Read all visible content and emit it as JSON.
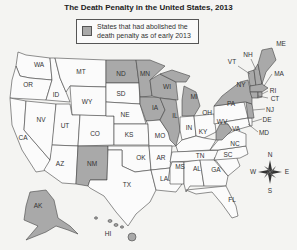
{
  "title": "The Death Penalty in the United States, 2013",
  "legend": {
    "line1": "States that had abolished the",
    "line2": "death penalty as of early 2013",
    "swatch_color": "#a9a9a9"
  },
  "colors": {
    "abolished": "#a9a9a9",
    "retained": "#fbfbfb",
    "border": "#444444"
  },
  "compass": {
    "n": "N",
    "s": "S",
    "e": "E",
    "w": "W"
  },
  "abolished_states": [
    "ND",
    "MN",
    "IA",
    "WI",
    "IL",
    "MI",
    "NM",
    "NY",
    "VT",
    "NH",
    "ME",
    "MA",
    "RI",
    "CT",
    "NJ",
    "WV",
    "AK",
    "HI"
  ],
  "labels": {
    "WA": "WA",
    "OR": "OR",
    "CA": "CA",
    "ID": "ID",
    "NV": "NV",
    "MT": "MT",
    "WY": "WY",
    "UT": "UT",
    "AZ": "AZ",
    "CO": "CO",
    "NM": "NM",
    "ND": "ND",
    "SD": "SD",
    "NE": "NE",
    "KS": "KS",
    "OK": "OK",
    "TX": "TX",
    "MN": "MN",
    "IA": "IA",
    "MO": "MO",
    "AR": "AR",
    "LA": "LA",
    "WI": "WI",
    "IL": "IL",
    "MI": "MI",
    "IN": "IN",
    "OH": "OH",
    "KY": "KY",
    "TN": "TN",
    "MS": "MS",
    "AL": "AL",
    "GA": "GA",
    "FL": "FL",
    "SC": "SC",
    "NC": "NC",
    "VA": "VA",
    "WV": "WV",
    "PA": "PA",
    "NY": "NY",
    "VT": "VT",
    "NH": "NH",
    "ME": "ME",
    "MA": "MA",
    "RI": "RI",
    "CT": "CT",
    "NJ": "NJ",
    "DE": "DE",
    "MD": "MD",
    "AK": "AK",
    "HI": "HI"
  }
}
